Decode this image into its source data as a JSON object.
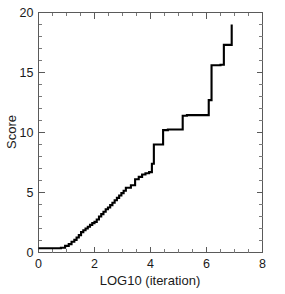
{
  "figure": {
    "width": 285,
    "height": 294,
    "background_color": "#ffffff",
    "axis_color": "#5a5a5a",
    "data_color": "#000000"
  },
  "chart_data": {
    "type": "line",
    "title": "",
    "subtitle": "",
    "xlabel": "LOG10 (iteration)",
    "ylabel": "Score",
    "xlim": [
      0,
      8
    ],
    "ylim": [
      0,
      20
    ],
    "grid": false,
    "legend": false,
    "legend_position": "none",
    "line_style": "step-post",
    "x_major_ticks": [
      0,
      2,
      4,
      6,
      8
    ],
    "x_major_tick_labels": [
      "0",
      "2",
      "4",
      "6",
      "8"
    ],
    "x_minor_tick_interval": 0.5,
    "y_major_ticks": [
      0,
      5,
      10,
      15,
      20
    ],
    "y_major_tick_labels": [
      "0",
      "5",
      "10",
      "15",
      "20"
    ],
    "y_minor_tick_interval": 1,
    "series": [
      {
        "name": "Score",
        "color": "#000000",
        "x": [
          0.0,
          0.8,
          0.95,
          1.08,
          1.18,
          1.28,
          1.36,
          1.44,
          1.52,
          1.6,
          1.68,
          1.76,
          1.84,
          1.92,
          2.0,
          2.08,
          2.16,
          2.24,
          2.32,
          2.4,
          2.48,
          2.56,
          2.64,
          2.72,
          2.8,
          2.88,
          2.96,
          3.04,
          3.12,
          3.3,
          3.45,
          3.58,
          3.7,
          3.82,
          3.95,
          4.05,
          4.12,
          4.45,
          4.62,
          5.15,
          5.3,
          6.08,
          6.18,
          6.5,
          6.62,
          6.9
        ],
        "y": [
          0.35,
          0.4,
          0.55,
          0.7,
          0.9,
          1.05,
          1.25,
          1.45,
          1.7,
          1.85,
          2.0,
          2.15,
          2.3,
          2.45,
          2.55,
          2.75,
          3.0,
          3.2,
          3.4,
          3.6,
          3.75,
          3.95,
          4.15,
          4.35,
          4.55,
          4.75,
          4.95,
          5.15,
          5.4,
          5.6,
          6.1,
          6.3,
          6.5,
          6.6,
          6.7,
          7.4,
          9.0,
          10.2,
          10.25,
          11.4,
          11.45,
          12.7,
          15.6,
          15.65,
          17.3,
          19.0
        ],
        "plateaus": [
          {
            "level": 0.35,
            "x_start": 0.0,
            "x_end": 0.8
          },
          {
            "level": 10.2,
            "x_start": 4.12,
            "x_end": 4.62
          },
          {
            "level": 11.4,
            "x_start": 4.62,
            "x_end": 5.3
          },
          {
            "level": 12.7,
            "x_start": 5.3,
            "x_end": 6.08
          },
          {
            "level": 15.6,
            "x_start": 6.18,
            "x_end": 6.62
          },
          {
            "level": 17.3,
            "x_start": 6.62,
            "x_end": 6.9
          }
        ],
        "start_value": 0.35,
        "end_value": 19.0,
        "end_x": 6.9
      }
    ]
  }
}
